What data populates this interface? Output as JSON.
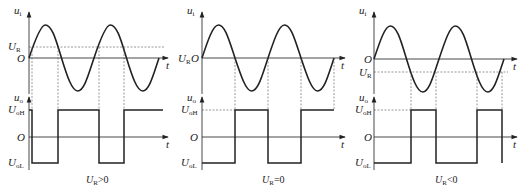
{
  "figure": {
    "panels": [
      {
        "id": "ur-positive",
        "caption_main": "U",
        "caption_sub": "R",
        "caption_rel": ">0",
        "input_label": "u",
        "input_sub": "i",
        "output_label": "u",
        "output_sub": "o",
        "ur_label": "U",
        "ur_sub": "R",
        "origin_label": "O",
        "time_label": "t",
        "uoh_label": "U",
        "uoh_sub": "oH",
        "uol_label": "U",
        "uol_sub": "oL"
      },
      {
        "id": "ur-zero",
        "caption_main": "U",
        "caption_sub": "R",
        "caption_rel": "=0",
        "input_label": "u",
        "input_sub": "i",
        "output_label": "u",
        "output_sub": "o",
        "ur_label": "U",
        "ur_sub": "R",
        "origin_label": "O",
        "time_label": "t",
        "uoh_label": "U",
        "uoh_sub": "oH",
        "uol_label": "U",
        "uol_sub": "oL"
      },
      {
        "id": "ur-negative",
        "caption_main": "U",
        "caption_sub": "R",
        "caption_rel": "<0",
        "input_label": "u",
        "input_sub": "i",
        "output_label": "u",
        "output_sub": "o",
        "ur_label": "U",
        "ur_sub": "R",
        "origin_label": "O",
        "time_label": "t",
        "uoh_label": "U",
        "uoh_sub": "oH",
        "uol_label": "U",
        "uol_sub": "oL"
      }
    ]
  }
}
